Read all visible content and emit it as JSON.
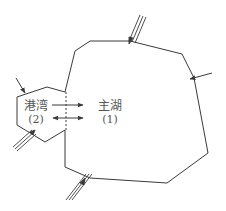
{
  "diagram": {
    "type": "lake-basin schematic",
    "regions": [
      {
        "id": "harbor",
        "label": "港湾",
        "index": "(2)"
      },
      {
        "id": "main_lake",
        "label": "主湖",
        "index": "(1)"
      }
    ],
    "exchanges": [
      {
        "from": "harbor",
        "to": "main_lake",
        "kind": "one-way"
      },
      {
        "from": "harbor",
        "to": "main_lake",
        "kind": "two-way"
      }
    ],
    "inflows": [
      {
        "location": "main lake top",
        "kind": "river (triple line)"
      },
      {
        "location": "main lake right",
        "kind": "single arrow"
      },
      {
        "location": "harbor top-left",
        "kind": "single arrow"
      },
      {
        "location": "harbor bottom-left",
        "kind": "river (triple line)"
      },
      {
        "location": "main lake bottom-left",
        "kind": "river (triple line)"
      }
    ],
    "colors": {
      "line": "#3a3a3a",
      "label": "#555555",
      "background": "#ffffff"
    }
  },
  "labels": {
    "harbor_name": "港湾",
    "harbor_index": "(2)",
    "main_name": "主湖",
    "main_index": "(1)"
  }
}
